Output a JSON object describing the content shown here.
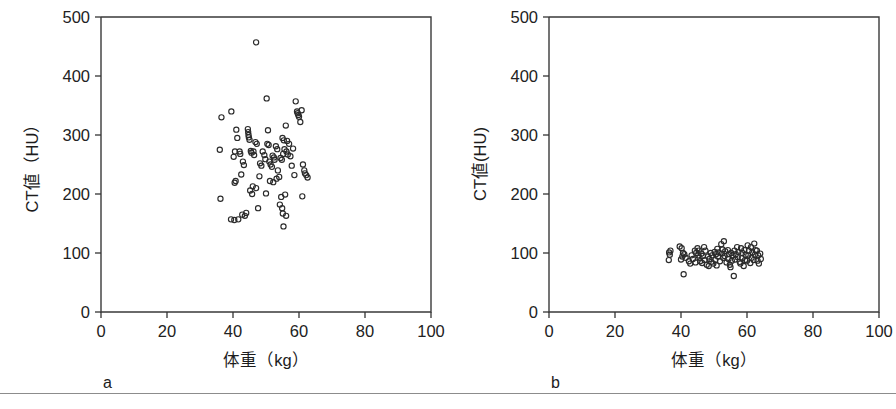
{
  "figure": {
    "panels": [
      {
        "id": "a",
        "letter": "a",
        "xlabel": "体重（kg）",
        "ylabel": "CT値（HU）"
      },
      {
        "id": "b",
        "letter": "b",
        "xlabel": "体重（kg）",
        "ylabel": "CT値(HU)"
      }
    ],
    "colors": {
      "axis": "#333333",
      "marker_stroke": "#2b2b2b",
      "background": "#ffffff",
      "footer_rule": "#8c8c8c"
    },
    "ticks": {
      "x_labels": [
        "0",
        "20",
        "40",
        "60",
        "80",
        "100"
      ],
      "y_labels": [
        "0",
        "100",
        "200",
        "300",
        "400",
        "500"
      ]
    }
  },
  "chart_data": [
    {
      "type": "scatter",
      "panel": "a",
      "title": "",
      "xlabel": "体重（kg）",
      "ylabel": "CT値（HU）",
      "xlim": [
        0,
        100
      ],
      "ylim": [
        0,
        500
      ],
      "xticks": [
        0,
        20,
        40,
        60,
        80,
        100
      ],
      "yticks": [
        0,
        100,
        200,
        300,
        400,
        500
      ],
      "grid": false,
      "legend": "none",
      "marker": "open-circle",
      "n_points": 96,
      "points": [
        [
          47,
          457
        ],
        [
          36.5,
          330
        ],
        [
          39.5,
          340
        ],
        [
          36.0,
          275
        ],
        [
          36.2,
          192
        ],
        [
          41.0,
          309
        ],
        [
          41.3,
          295
        ],
        [
          40.6,
          272
        ],
        [
          40.2,
          263
        ],
        [
          40.8,
          222
        ],
        [
          40.5,
          219
        ],
        [
          42.5,
          233
        ],
        [
          42.0,
          272
        ],
        [
          42.2,
          268
        ],
        [
          43.0,
          255
        ],
        [
          43.3,
          249
        ],
        [
          44.5,
          310
        ],
        [
          44.6,
          305
        ],
        [
          44.7,
          300
        ],
        [
          44.8,
          296
        ],
        [
          45.0,
          292
        ],
        [
          45.4,
          273
        ],
        [
          45.6,
          270
        ],
        [
          45.2,
          206
        ],
        [
          45.8,
          200
        ],
        [
          44.0,
          168
        ],
        [
          42.8,
          165
        ],
        [
          39.4,
          157
        ],
        [
          40.4,
          156
        ],
        [
          41.6,
          157
        ],
        [
          43.6,
          163
        ],
        [
          46.2,
          272
        ],
        [
          46.4,
          266
        ],
        [
          46.8,
          288
        ],
        [
          47.2,
          285
        ],
        [
          46.0,
          213
        ],
        [
          47.0,
          210
        ],
        [
          47.6,
          176
        ],
        [
          48.2,
          252
        ],
        [
          48.6,
          248
        ],
        [
          48.0,
          230
        ],
        [
          49.0,
          272
        ],
        [
          49.5,
          266
        ],
        [
          49.8,
          259
        ],
        [
          50.2,
          362
        ],
        [
          50.6,
          308
        ],
        [
          50.4,
          285
        ],
        [
          50.8,
          283
        ],
        [
          51.0,
          255
        ],
        [
          51.4,
          250
        ],
        [
          51.8,
          246
        ],
        [
          52.0,
          265
        ],
        [
          52.4,
          262
        ],
        [
          52.6,
          258
        ],
        [
          51.2,
          222
        ],
        [
          52.2,
          220
        ],
        [
          50.0,
          201
        ],
        [
          53.0,
          281
        ],
        [
          53.4,
          276
        ],
        [
          53.6,
          240
        ],
        [
          53.2,
          226
        ],
        [
          54.0,
          229
        ],
        [
          54.4,
          261
        ],
        [
          54.8,
          258
        ],
        [
          55.0,
          295
        ],
        [
          55.4,
          291
        ],
        [
          55.6,
          276
        ],
        [
          55.2,
          268
        ],
        [
          56.0,
          316
        ],
        [
          56.4,
          290
        ],
        [
          56.2,
          272
        ],
        [
          56.6,
          267
        ],
        [
          55.8,
          199
        ],
        [
          54.6,
          195
        ],
        [
          54.2,
          182
        ],
        [
          54.9,
          176
        ],
        [
          55.1,
          167
        ],
        [
          56.1,
          163
        ],
        [
          55.3,
          145
        ],
        [
          57.0,
          285
        ],
        [
          57.4,
          264
        ],
        [
          57.8,
          248
        ],
        [
          58.2,
          277
        ],
        [
          58.6,
          232
        ],
        [
          59.0,
          357
        ],
        [
          59.4,
          340
        ],
        [
          59.6,
          337
        ],
        [
          59.8,
          334
        ],
        [
          60.0,
          331
        ],
        [
          60.4,
          322
        ],
        [
          60.8,
          342
        ],
        [
          61.2,
          250
        ],
        [
          61.6,
          240
        ],
        [
          61.8,
          235
        ],
        [
          62.2,
          232
        ],
        [
          62.6,
          228
        ],
        [
          61.0,
          196
        ]
      ]
    },
    {
      "type": "scatter",
      "panel": "b",
      "title": "",
      "xlabel": "体重（kg）",
      "ylabel": "CT値(HU)",
      "xlim": [
        0,
        100
      ],
      "ylim": [
        0,
        500
      ],
      "xticks": [
        0,
        20,
        40,
        60,
        80,
        100
      ],
      "yticks": [
        0,
        100,
        200,
        300,
        400,
        500
      ],
      "grid": false,
      "legend": "none",
      "marker": "open-circle",
      "n_points": 96,
      "points": [
        [
          36.4,
          101
        ],
        [
          36.6,
          97
        ],
        [
          36.3,
          88
        ],
        [
          36.8,
          104
        ],
        [
          39.6,
          111
        ],
        [
          40.2,
          108
        ],
        [
          40.6,
          100
        ],
        [
          40.4,
          94
        ],
        [
          40.0,
          89
        ],
        [
          41.0,
          98
        ],
        [
          41.4,
          92
        ],
        [
          40.8,
          64
        ],
        [
          42.4,
          86
        ],
        [
          42.8,
          82
        ],
        [
          43.2,
          96
        ],
        [
          43.6,
          90
        ],
        [
          44.2,
          104
        ],
        [
          44.6,
          100
        ],
        [
          44.4,
          84
        ],
        [
          45.0,
          108
        ],
        [
          45.4,
          104
        ],
        [
          45.2,
          96
        ],
        [
          45.6,
          92
        ],
        [
          45.8,
          86
        ],
        [
          46.2,
          99
        ],
        [
          46.6,
          95
        ],
        [
          46.4,
          83
        ],
        [
          47.0,
          110
        ],
        [
          47.4,
          104
        ],
        [
          47.2,
          88
        ],
        [
          47.8,
          80
        ],
        [
          48.2,
          94
        ],
        [
          48.6,
          90
        ],
        [
          48.4,
          78
        ],
        [
          49.0,
          100
        ],
        [
          49.4,
          96
        ],
        [
          49.2,
          85
        ],
        [
          49.8,
          82
        ],
        [
          50.2,
          102
        ],
        [
          50.6,
          98
        ],
        [
          50.4,
          88
        ],
        [
          50.8,
          79
        ],
        [
          51.0,
          107
        ],
        [
          51.4,
          101
        ],
        [
          51.2,
          94
        ],
        [
          51.8,
          86
        ],
        [
          52.2,
          115
        ],
        [
          52.6,
          106
        ],
        [
          52.4,
          99
        ],
        [
          52.8,
          92
        ],
        [
          53.0,
          120
        ],
        [
          53.4,
          103
        ],
        [
          53.2,
          95
        ],
        [
          53.8,
          84
        ],
        [
          54.2,
          105
        ],
        [
          54.6,
          98
        ],
        [
          54.4,
          90
        ],
        [
          54.8,
          80
        ],
        [
          55.2,
          100
        ],
        [
          55.6,
          96
        ],
        [
          55.4,
          87
        ],
        [
          55.0,
          76
        ],
        [
          56.2,
          104
        ],
        [
          56.6,
          98
        ],
        [
          56.4,
          89
        ],
        [
          56.0,
          61
        ],
        [
          57.0,
          110
        ],
        [
          57.4,
          102
        ],
        [
          57.2,
          93
        ],
        [
          57.8,
          85
        ],
        [
          58.2,
          108
        ],
        [
          58.6,
          100
        ],
        [
          58.4,
          91
        ],
        [
          58.0,
          82
        ],
        [
          59.2,
          105
        ],
        [
          59.6,
          97
        ],
        [
          59.4,
          88
        ],
        [
          59.0,
          78
        ],
        [
          60.2,
          113
        ],
        [
          60.6,
          104
        ],
        [
          60.4,
          96
        ],
        [
          60.0,
          87
        ],
        [
          61.2,
          110
        ],
        [
          61.6,
          101
        ],
        [
          61.4,
          92
        ],
        [
          61.0,
          83
        ],
        [
          62.2,
          116
        ],
        [
          62.6,
          105
        ],
        [
          62.4,
          97
        ],
        [
          62.0,
          88
        ],
        [
          63.0,
          104
        ],
        [
          63.4,
          96
        ],
        [
          63.2,
          87
        ],
        [
          63.6,
          82
        ],
        [
          64.0,
          99
        ],
        [
          64.2,
          90
        ]
      ]
    }
  ]
}
